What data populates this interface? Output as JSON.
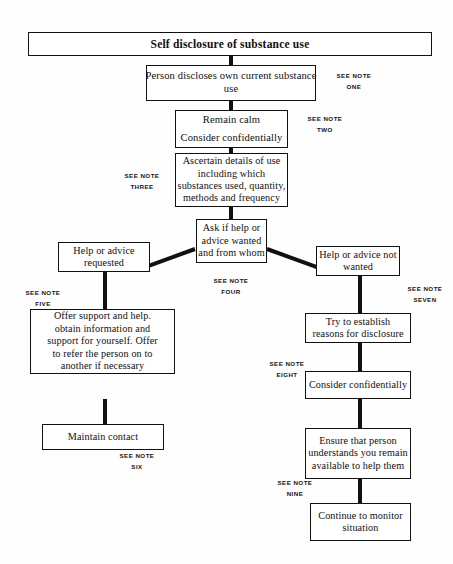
{
  "document": {
    "title": "Self disclosure of substance use",
    "type": "flowchart"
  },
  "nodes": {
    "title": {
      "line1": "Self disclosure of substance use"
    },
    "disclose": {
      "line1": "Person discloses own current substance",
      "line2": "use"
    },
    "remain_calm": {
      "line1": "Remain calm",
      "line2": "Consider confidentially"
    },
    "ascertain": {
      "line1": "Ascertain details of use",
      "line2": "including which",
      "line3": "substances used, quantity,",
      "line4": "methods and frequency"
    },
    "ask_if_help": {
      "line1": "Ask if help or",
      "line2": "advice wanted",
      "line3": "and from whom"
    },
    "help_requested": {
      "line1": "Help or advice",
      "line2": "requested"
    },
    "help_not_wanted": {
      "line1": "Help or advice not",
      "line2": "wanted"
    },
    "offer_support": {
      "line1": "Offer support and help.",
      "line2": "obtain information and",
      "line3": "support for yourself. Offer",
      "line4": "to refer the person on to",
      "line5": "another if necessary"
    },
    "maintain_contact": {
      "line1": "Maintain contact"
    },
    "try_establish": {
      "line1": "Try to establish",
      "line2": "reasons for disclosure"
    },
    "consider_confidentially": {
      "line1": "Consider confidentially"
    },
    "ensure_person": {
      "line1": "Ensure that person",
      "line2": "understands you remain",
      "line3": "available to help them"
    },
    "continue_monitor": {
      "line1": "Continue to monitor",
      "line2": "situation"
    }
  },
  "notes": {
    "prefix": "SEE NOTE",
    "one": "ONE",
    "two": "TWO",
    "three": "THREE",
    "four": "FOUR",
    "five": "FIVE",
    "six": "SIX",
    "seven": "SEVEN",
    "eight": "EIGHT",
    "nine": "NINE"
  },
  "style": {
    "ink": "#111111",
    "paper": "#fefefe"
  }
}
